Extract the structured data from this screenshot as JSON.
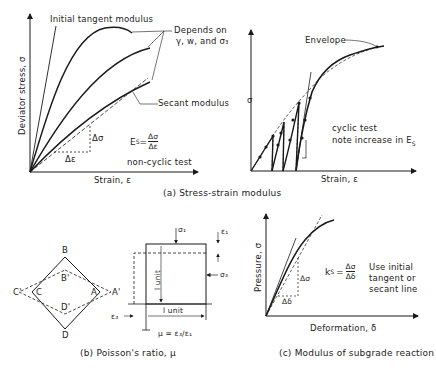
{
  "figure": {
    "panel_a": {
      "caption": "(a) Stress-strain modulus",
      "left": {
        "ylabel": "Deviator stress, σ",
        "xlabel": "Strain, ε",
        "initial_tangent_label": "Initial tangent modulus",
        "depends_label_line1": "Depends on",
        "depends_label_line2": "γ, w, and σ₃",
        "secant_label": "Secant modulus",
        "formula_lhs": "E",
        "formula_sub": "S",
        "formula_num": "Δσ",
        "formula_den": "Δε",
        "delta_sigma": "Δσ",
        "delta_eps": "Δε",
        "test_note": "non-cyclic test"
      },
      "right": {
        "ylabel": "σ",
        "xlabel": "Strain, ε",
        "envelope_label": "Envelope",
        "note_line1": "cyclic test",
        "note_line2": "note increase in E",
        "note_sub": "S"
      }
    },
    "panel_b": {
      "caption": "(b) Poisson's ratio, μ",
      "diamond_labels": {
        "B": "B",
        "B_prime": "B'",
        "C": "C",
        "C_prime": "C'",
        "A": "A",
        "A_prime": "A'",
        "D": "D",
        "D_prime": "D'"
      },
      "sigma1": "σ₁",
      "sigma3": "σ₃",
      "eps1": "ε₁",
      "eps3": "ε₃",
      "unit_vertical": "l unit",
      "unit_horizontal": "l unit",
      "formula": "μ = ε₃/ε₁"
    },
    "panel_c": {
      "caption": "(c) Modulus of subgrade reaction",
      "ylabel": "Pressure, σ",
      "xlabel": "Deformation, δ",
      "formula_lhs": "k",
      "formula_sub": "S",
      "formula_num": "Δσ",
      "formula_den": "Δδ",
      "delta_sigma": "Δσ",
      "delta_delta": "Δδ",
      "note_line1": "Use initial",
      "note_line2": "tangent or",
      "note_line3": "secant line"
    },
    "colors": {
      "ink": "#1a1a1a",
      "background": "#ffffff"
    }
  }
}
